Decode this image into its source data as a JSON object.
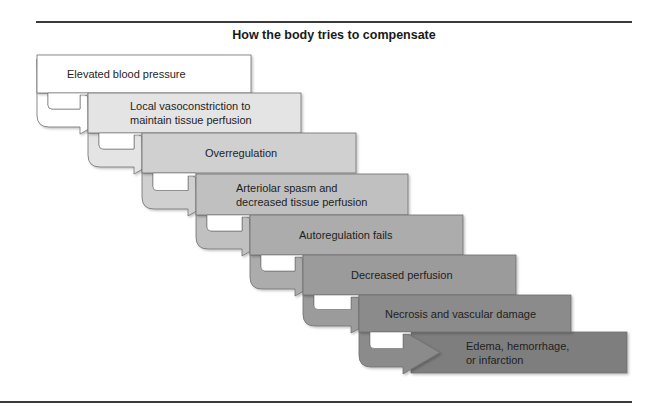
{
  "figure": {
    "title": "How the body tries to compensate"
  },
  "steps": [
    {
      "label": "Elevated blood pressure",
      "fill": "#ffffff",
      "x": 37,
      "y": 55,
      "w": 214,
      "h": 38,
      "text_x": 67,
      "align": "left"
    },
    {
      "label": "Local vasoconstriction to\nmaintain tissue perfusion",
      "fill": "#e4e4e4",
      "x": 88,
      "y": 93,
      "w": 213,
      "h": 40,
      "text_x": 130,
      "align": "left"
    },
    {
      "label": "Overregulation",
      "fill": "#d0d0d0",
      "x": 142,
      "y": 133,
      "w": 214,
      "h": 40,
      "text_x": 205,
      "align": "left"
    },
    {
      "label": "Arteriolar spasm and\ndecreased tissue perfusion",
      "fill": "#c0c0c0",
      "x": 196,
      "y": 174,
      "w": 212,
      "h": 41,
      "text_x": 236,
      "align": "left"
    },
    {
      "label": "Autoregulation fails",
      "fill": "#acacac",
      "x": 250,
      "y": 215,
      "w": 213,
      "h": 40,
      "text_x": 299,
      "align": "left"
    },
    {
      "label": "Decreased perfusion",
      "fill": "#9b9b9b",
      "x": 303,
      "y": 255,
      "w": 213,
      "h": 40,
      "text_x": 351,
      "align": "left"
    },
    {
      "label": "Necrosis and vascular damage",
      "fill": "#8b8b8b",
      "x": 359,
      "y": 295,
      "w": 212,
      "h": 37,
      "text_x": 385,
      "align": "left"
    },
    {
      "label": "Edema, hemorrhage,\nor infarction",
      "fill": "#7e7e7e",
      "x": 411,
      "y": 332,
      "w": 216,
      "h": 41,
      "text_x": 466,
      "align": "left"
    }
  ],
  "rules": {
    "top": {
      "x": 36,
      "y": 21,
      "w": 596
    },
    "bottom": {
      "x": 0,
      "y": 401,
      "w": 632
    }
  },
  "colors": {
    "stroke": "#6f6f6f",
    "rule": "#3a3a3a",
    "notch": "#ffffff"
  }
}
